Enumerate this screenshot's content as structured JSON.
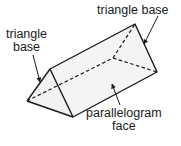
{
  "diagram": {
    "labels": {
      "triangle_base_right": "triangle base",
      "triangle_base_left_line1": "triangle",
      "triangle_base_left_line2": "base",
      "parallelogram_line1": "parallelogram",
      "parallelogram_line2": "face"
    },
    "colors": {
      "stroke": "#1a1a1a",
      "face_fill": "#f4f4f4",
      "background": "#ffffff"
    }
  }
}
